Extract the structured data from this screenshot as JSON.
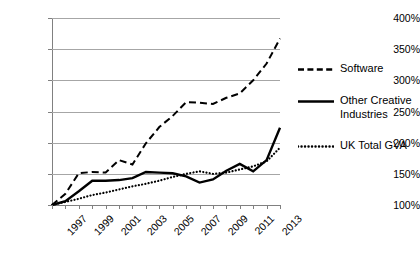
{
  "chart_data": {
    "type": "line",
    "title": "",
    "subtitle": "",
    "xlabel": "",
    "ylabel": "",
    "ylim": [
      100,
      400
    ],
    "ytick_values": [
      100,
      150,
      200,
      250,
      300,
      350,
      400
    ],
    "ytick_labels": [
      "100%",
      "150%",
      "200%",
      "250%",
      "300%",
      "350%",
      "400%"
    ],
    "grid": true,
    "legend_position": "right",
    "x": [
      1997,
      1998,
      1999,
      2000,
      2001,
      2002,
      2003,
      2004,
      2005,
      2006,
      2007,
      2008,
      2009,
      2010,
      2011,
      2012,
      2013,
      2014
    ],
    "xtick_labels": [
      "1997",
      "",
      "1999",
      "",
      "2001",
      "",
      "2003",
      "",
      "2005",
      "",
      "2007",
      "",
      "2009",
      "",
      "2011",
      "",
      "2013",
      ""
    ],
    "xtick_labels_shown": [
      "1997",
      "1999",
      "2001",
      "2003",
      "2005",
      "2007",
      "2009",
      "2011",
      "2013"
    ],
    "series": [
      {
        "name": "Software",
        "style": "dashed",
        "color": "#000000",
        "values": [
          100,
          118,
          151,
          153,
          152,
          172,
          165,
          199,
          225,
          243,
          265,
          264,
          262,
          272,
          279,
          300,
          327,
          367
        ]
      },
      {
        "name": "Other Creative Industries",
        "style": "solid",
        "color": "#000000",
        "values": [
          100,
          106,
          122,
          139,
          139,
          140,
          143,
          153,
          152,
          151,
          146,
          136,
          141,
          155,
          166,
          154,
          172,
          224
        ]
      },
      {
        "name": "UK Total GVA",
        "style": "dotted",
        "color": "#000000",
        "values": [
          100,
          105,
          110,
          116,
          120,
          125,
          130,
          134,
          139,
          145,
          150,
          154,
          150,
          152,
          157,
          162,
          170,
          192
        ]
      }
    ]
  },
  "legend": {
    "items": [
      {
        "label": "Software",
        "style": "dashed"
      },
      {
        "label": "Other Creative Industries",
        "style": "solid"
      },
      {
        "label": "UK Total GVA",
        "style": "dotted"
      }
    ]
  }
}
